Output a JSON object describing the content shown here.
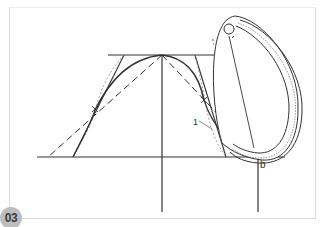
{
  "figure": {
    "number": "03",
    "labels": {
      "marker_1": "1",
      "point_b": "b"
    },
    "colors": {
      "line": "#333333",
      "frame": "#dcdcdc",
      "badge_bg": "#bdbdbd",
      "badge_text": "#3c3c3c"
    }
  }
}
